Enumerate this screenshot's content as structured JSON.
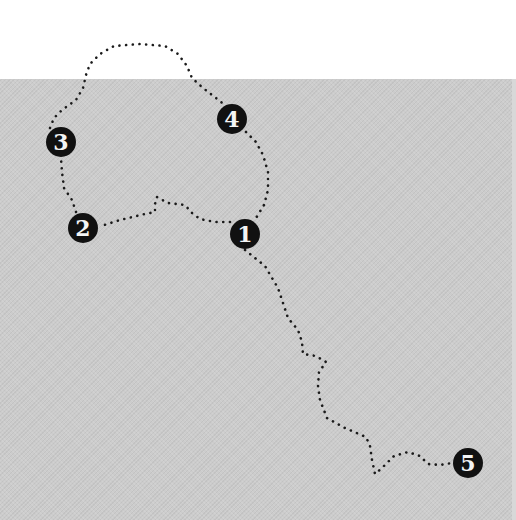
{
  "map": {
    "background_color": "#ffffff",
    "land_color": "#cccccc",
    "route_color": "#1a1a1a",
    "marker_color": "#111111",
    "marker_text_color": "#f4f4f4"
  },
  "markers": [
    {
      "label": "1",
      "x": 245,
      "y": 234
    },
    {
      "label": "2",
      "x": 83,
      "y": 228
    },
    {
      "label": "3",
      "x": 61,
      "y": 142
    },
    {
      "label": "4",
      "x": 232,
      "y": 119
    },
    {
      "label": "5",
      "x": 468,
      "y": 463
    }
  ],
  "route": {
    "segment_1_to_2": "M230,222 L215,222 L200,219 L192,213 L185,205 L168,203 L157,197 L155,204 L155,212 L145,214 L120,220 L101,226",
    "segment_2_to_3": "M76,212 L72,200 L64,188 L62,172 L61,158",
    "segment_3_to_4": "M50,128 L54,118 L62,110 L76,100 L83,88 L86,75 L90,64 L100,54 L114,46 L140,44 L165,46 L178,54 L187,66 L192,78 L203,88 L216,98 L226,106",
    "segment_4_to_1": "M246,132 L256,142 L263,155 L268,172 L268,190 L264,205 L256,218",
    "segment_1_to_5": "M245,250 L255,258 L265,266 L272,278 L278,288 L282,300 L288,318 L298,330 L302,342 L303,354 L316,356 L326,362 L319,372 L318,386 L320,400 L327,418 L345,428 L366,437 L370,446 L372,460 L375,474 L382,468 L394,456 L408,452 L420,456 L428,464 L440,465 L452,463"
  }
}
